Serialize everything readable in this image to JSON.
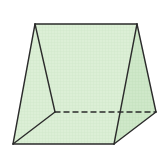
{
  "diagram": {
    "type": "triangular-prism",
    "colors": {
      "background": "#ffffff",
      "face_fill": "#dcefd6",
      "right_face_fill": "#cfe8c9",
      "grid": "#c8e2c1",
      "edge": "#2b2b2b"
    },
    "vertices": {
      "apex_front": [
        35,
        24
      ],
      "apex_back": [
        137,
        24
      ],
      "front_bottom_left": [
        13,
        144
      ],
      "front_bottom_right": [
        114,
        144
      ],
      "back_bottom_left": [
        55,
        112
      ],
      "back_bottom_right": [
        156,
        112
      ]
    },
    "edges": {
      "solid": [
        [
          "apex_front",
          "apex_back"
        ],
        [
          "apex_front",
          "front_bottom_left"
        ],
        [
          "apex_front",
          "back_bottom_left"
        ],
        [
          "apex_back",
          "front_bottom_right"
        ],
        [
          "apex_back",
          "back_bottom_right"
        ],
        [
          "front_bottom_left",
          "front_bottom_right"
        ],
        [
          "front_bottom_left",
          "back_bottom_left"
        ],
        [
          "front_bottom_right",
          "back_bottom_right"
        ]
      ],
      "hidden": [
        [
          "back_bottom_left",
          "back_bottom_right"
        ]
      ]
    }
  }
}
